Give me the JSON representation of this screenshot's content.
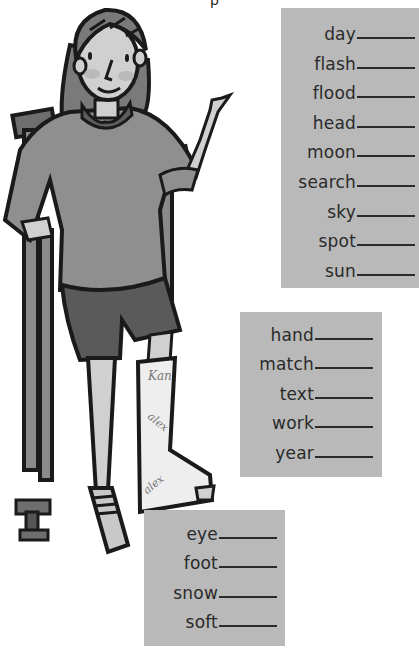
{
  "header": {
    "cropped_title_fragment": "p"
  },
  "illustration": {
    "subject": "girl-on-crutches-with-leg-cast",
    "cast_signatures": [
      "Kan",
      "alex",
      "alex"
    ],
    "colors": {
      "outline": "#1a1a1a",
      "shirt": "#8f8f8f",
      "shorts": "#5a5a5a",
      "skin": "#d0d0d0",
      "hair": "#7a7a7a",
      "crutch": "#6e6e6e",
      "cast": "#eeeeee"
    }
  },
  "word_boxes": [
    {
      "id": "box1",
      "words": [
        "day",
        "flash",
        "flood",
        "head",
        "moon",
        "search",
        "sky",
        "spot",
        "sun"
      ]
    },
    {
      "id": "box2",
      "words": [
        "hand",
        "match",
        "text",
        "work",
        "year"
      ]
    },
    {
      "id": "box3",
      "words": [
        "eye",
        "foot",
        "snow",
        "soft"
      ]
    }
  ],
  "colors": {
    "box_background": "#b9b9b9",
    "text": "#2a2a2a",
    "page_background": "#ffffff"
  }
}
